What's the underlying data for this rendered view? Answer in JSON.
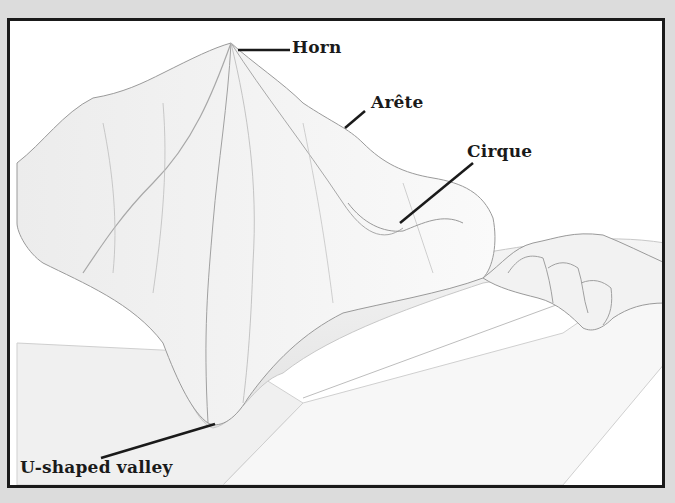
{
  "diagram": {
    "labels": {
      "horn": "Horn",
      "arete": "Arête",
      "cirque": "Cirque",
      "valley": "U-shaped valley"
    },
    "colors": {
      "border": "#1a1a1a",
      "background": "#dcdcdc",
      "panel": "#ffffff",
      "shading": "#d8d8d8"
    }
  }
}
